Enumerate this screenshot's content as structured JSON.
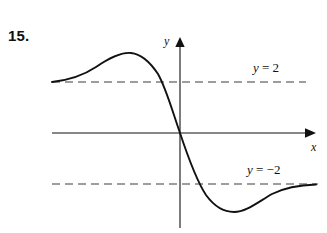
{
  "page": {
    "background_color": "#ffffff",
    "ink_color": "#111111",
    "top_bleed_fragment_left": "''",
    "top_bleed_fragment_right": "'''"
  },
  "problem": {
    "number_label": "15."
  },
  "chart_data": {
    "type": "line",
    "title": "",
    "subtitle": "",
    "xlabel": "x",
    "ylabel": "y",
    "grid": false,
    "legend": "none",
    "axes": {
      "x_axis_label": "x",
      "y_axis_label": "y",
      "x_arrow": true,
      "y_arrow": true,
      "origin_px": [
        180,
        133
      ],
      "xlim": [
        -4.2,
        7.2
      ],
      "ylim": [
        -3.6,
        3.4
      ]
    },
    "annotations": [
      {
        "name": "upper-asymptote-label",
        "text": "y = 2",
        "variable": "y",
        "relation": "=",
        "value": 2,
        "px": [
          253,
          68
        ]
      },
      {
        "name": "lower-asymptote-label",
        "text": "y = −2",
        "variable": "y",
        "relation": "=",
        "value": -2,
        "px": [
          247,
          170
        ]
      }
    ],
    "asymptotes": [
      {
        "name": "upper-asymptote",
        "orientation": "horizontal",
        "y": 2,
        "style": "dashed",
        "label": "y = 2",
        "y_px": 82,
        "x_start_px": 52,
        "x_end_px": 306
      },
      {
        "name": "lower-asymptote",
        "orientation": "horizontal",
        "y": -2,
        "style": "dashed",
        "label": "y = −2",
        "y_px": 184,
        "x_start_px": 52,
        "x_end_px": 318
      }
    ],
    "series": [
      {
        "name": "curve",
        "style": "solid",
        "color": "#111111",
        "description": "S-shaped decreasing curve: left tail approaches y = 2 from below, rises to a local maximum near (-2.0, 2.6), descends steeply through the origin, falls to a local minimum near (2.2, -3.0), then rises and approaches y = -2 from below at the right.",
        "points_px": [
          [
            52,
            82
          ],
          [
            63,
            80
          ],
          [
            74,
            77
          ],
          [
            85,
            73
          ],
          [
            96,
            67
          ],
          [
            107,
            61
          ],
          [
            118,
            56
          ],
          [
            129,
            53
          ],
          [
            140,
            54
          ],
          [
            150,
            61
          ],
          [
            158,
            72
          ],
          [
            166,
            89
          ],
          [
            173,
            110
          ],
          [
            180,
            133
          ],
          [
            187,
            154
          ],
          [
            195,
            174
          ],
          [
            203,
            190
          ],
          [
            212,
            202
          ],
          [
            222,
            209
          ],
          [
            233,
            212
          ],
          [
            244,
            209
          ],
          [
            254,
            203
          ],
          [
            265,
            196
          ],
          [
            276,
            191
          ],
          [
            288,
            188
          ],
          [
            300,
            186
          ],
          [
            316,
            185
          ]
        ],
        "features": [
          {
            "name": "local-maximum",
            "x": -2.0,
            "y": 2.6,
            "px": [
              133,
              53
            ]
          },
          {
            "name": "x-intercept-origin",
            "x": 0,
            "y": 0,
            "px": [
              180,
              133
            ]
          },
          {
            "name": "local-minimum",
            "x": 2.2,
            "y": -3.0,
            "px": [
              234,
              212
            ]
          }
        ]
      }
    ]
  }
}
